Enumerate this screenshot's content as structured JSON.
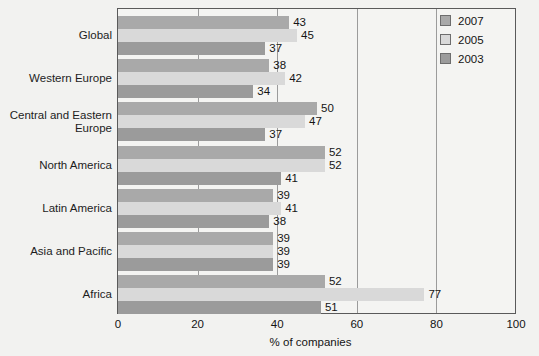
{
  "artifact_text": "",
  "chart_data": {
    "type": "bar",
    "orientation": "horizontal",
    "title": "",
    "xlabel": "% of companies",
    "ylabel": "",
    "xlim": [
      0,
      100
    ],
    "xticks": [
      0,
      20,
      40,
      60,
      80,
      100
    ],
    "xtick_labels": [
      "0",
      "20",
      "40",
      "60",
      "80",
      "100"
    ],
    "grid": "vertical gridlines at 20, 40, 60, 80",
    "legend_position": "top-right inside plot",
    "categories": [
      "Global",
      "Western Europe",
      "Central and Eastern Europe",
      "North America",
      "Latin America",
      "Asia and Pacific",
      "Africa"
    ],
    "series": [
      {
        "name": "2007",
        "color": "#a9a9a9",
        "values": [
          43,
          38,
          50,
          52,
          39,
          39,
          52
        ]
      },
      {
        "name": "2005",
        "color": "#d9d9d9",
        "values": [
          45,
          42,
          47,
          52,
          41,
          39,
          77
        ]
      },
      {
        "name": "2003",
        "color": "#9b9b9b",
        "values": [
          37,
          34,
          37,
          41,
          38,
          39,
          51
        ]
      }
    ]
  },
  "legend": {
    "items": [
      {
        "label": "2007",
        "color": "#a9a9a9"
      },
      {
        "label": "2005",
        "color": "#d9d9d9"
      },
      {
        "label": "2003",
        "color": "#9b9b9b"
      }
    ]
  },
  "axis": {
    "x_title": "% of companies",
    "tick_labels": [
      "0",
      "20",
      "40",
      "60",
      "80",
      "100"
    ]
  },
  "categories": [
    {
      "label": "Global",
      "lines": [
        "Global"
      ]
    },
    {
      "label": "Western Europe",
      "lines": [
        "Western Europe"
      ]
    },
    {
      "label": "Central and Eastern Europe",
      "lines": [
        "Central and Eastern",
        "Europe"
      ]
    },
    {
      "label": "North America",
      "lines": [
        "North America"
      ]
    },
    {
      "label": "Latin America",
      "lines": [
        "Latin America"
      ]
    },
    {
      "label": "Asia and Pacific",
      "lines": [
        "Asia and Pacific"
      ]
    },
    {
      "label": "Africa",
      "lines": [
        "Africa"
      ]
    }
  ]
}
